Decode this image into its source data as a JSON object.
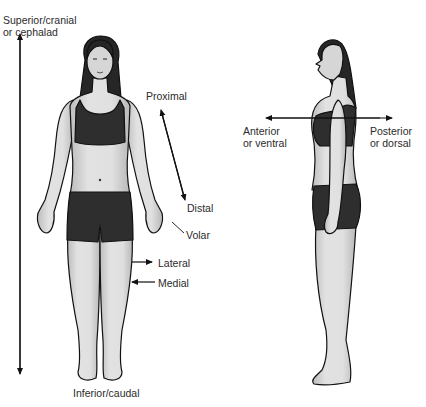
{
  "diagram": {
    "labels": {
      "superior_line1": "Superior/cranial",
      "superior_line2": "or cephalad",
      "inferior": "Inferior/caudal",
      "proximal": "Proximal",
      "distal": "Distal",
      "volar": "Volar",
      "lateral": "Lateral",
      "medial": "Medial",
      "anterior_line1": "Anterior",
      "anterior_line2": "or ventral",
      "posterior_line1": "Posterior",
      "posterior_line2": "or dorsal"
    },
    "figures": [
      {
        "view": "anterior",
        "description": "Front-facing female figure in dark sports top and shorts"
      },
      {
        "view": "lateral",
        "description": "Side-facing female figure in dark sports top and shorts"
      }
    ],
    "colors": {
      "background": "#ffffff",
      "skin": "#d9d9d9",
      "clothing": "#2e2e2e",
      "hair": "#262626",
      "outline": "#111111",
      "text": "#2b2b2b"
    }
  }
}
